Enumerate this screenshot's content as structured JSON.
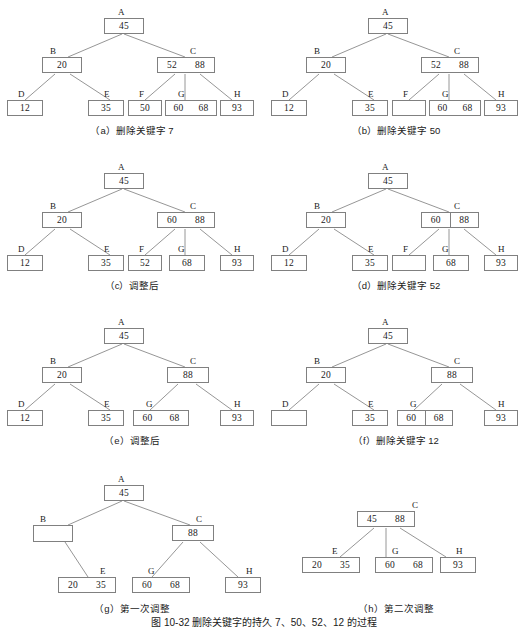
{
  "figure": {
    "caption": "图 10-32  删除关键字的持久 7、50、52、12 的过程",
    "node_label_names": [
      "A",
      "B",
      "C",
      "D",
      "E",
      "F",
      "G",
      "H"
    ]
  },
  "panels": [
    {
      "id": "a",
      "caption": "（a）删除关键字 7",
      "nodes": [
        {
          "name": "A",
          "keys": [
            "45"
          ],
          "divider": false
        },
        {
          "name": "B",
          "keys": [
            "20"
          ],
          "divider": false
        },
        {
          "name": "C",
          "keys": [
            "52",
            "88"
          ],
          "divider": false
        },
        {
          "name": "D",
          "keys": [
            "12"
          ],
          "divider": false
        },
        {
          "name": "E",
          "keys": [
            "35"
          ],
          "divider": false
        },
        {
          "name": "F",
          "keys": [
            "50"
          ],
          "divider": false
        },
        {
          "name": "G",
          "keys": [
            "60",
            "68"
          ],
          "divider": false
        },
        {
          "name": "H",
          "keys": [
            "93"
          ],
          "divider": false
        }
      ]
    },
    {
      "id": "b",
      "caption": "（b）删除关键字 50",
      "nodes": [
        {
          "name": "A",
          "keys": [
            "45"
          ],
          "divider": false
        },
        {
          "name": "B",
          "keys": [
            "20"
          ],
          "divider": false
        },
        {
          "name": "C",
          "keys": [
            "52",
            "88"
          ],
          "divider": false
        },
        {
          "name": "D",
          "keys": [
            "12"
          ],
          "divider": false
        },
        {
          "name": "E",
          "keys": [
            "35"
          ],
          "divider": false
        },
        {
          "name": "F",
          "keys": [
            ""
          ],
          "divider": false
        },
        {
          "name": "G",
          "keys": [
            "60",
            "68"
          ],
          "divider": false
        },
        {
          "name": "H",
          "keys": [
            "93"
          ],
          "divider": false
        }
      ]
    },
    {
      "id": "c",
      "caption": "（c）调整后",
      "nodes": [
        {
          "name": "A",
          "keys": [
            "45"
          ],
          "divider": false
        },
        {
          "name": "B",
          "keys": [
            "20"
          ],
          "divider": false
        },
        {
          "name": "C",
          "keys": [
            "60",
            "88"
          ],
          "divider": false
        },
        {
          "name": "D",
          "keys": [
            "12"
          ],
          "divider": false
        },
        {
          "name": "E",
          "keys": [
            "35"
          ],
          "divider": false
        },
        {
          "name": "F",
          "keys": [
            "52"
          ],
          "divider": false
        },
        {
          "name": "G",
          "keys": [
            "68"
          ],
          "divider": false
        },
        {
          "name": "H",
          "keys": [
            "93"
          ],
          "divider": false
        }
      ]
    },
    {
      "id": "d",
      "caption": "（d）删除关键字 52",
      "nodes": [
        {
          "name": "A",
          "keys": [
            "45"
          ],
          "divider": false
        },
        {
          "name": "B",
          "keys": [
            "20"
          ],
          "divider": false
        },
        {
          "name": "C",
          "keys": [
            "60",
            "88"
          ],
          "divider": true
        },
        {
          "name": "D",
          "keys": [
            "12"
          ],
          "divider": false
        },
        {
          "name": "E",
          "keys": [
            "35"
          ],
          "divider": false
        },
        {
          "name": "F",
          "keys": [
            ""
          ],
          "divider": false
        },
        {
          "name": "G",
          "keys": [
            "68"
          ],
          "divider": false
        },
        {
          "name": "H",
          "keys": [
            "93"
          ],
          "divider": false
        }
      ]
    },
    {
      "id": "e",
      "caption": "（e）调整后",
      "nodes": [
        {
          "name": "A",
          "keys": [
            "45"
          ],
          "divider": false
        },
        {
          "name": "B",
          "keys": [
            "20"
          ],
          "divider": false
        },
        {
          "name": "C",
          "keys": [
            "88"
          ],
          "divider": false
        },
        {
          "name": "D",
          "keys": [
            "12"
          ],
          "divider": false
        },
        {
          "name": "E",
          "keys": [
            "35"
          ],
          "divider": false
        },
        {
          "name": "G",
          "keys": [
            "60",
            "68"
          ],
          "divider": false
        },
        {
          "name": "H",
          "keys": [
            "93"
          ],
          "divider": false
        }
      ]
    },
    {
      "id": "f",
      "caption": "（f）删除关键字 12",
      "nodes": [
        {
          "name": "A",
          "keys": [
            "45"
          ],
          "divider": false
        },
        {
          "name": "B",
          "keys": [
            "20"
          ],
          "divider": false
        },
        {
          "name": "C",
          "keys": [
            "88"
          ],
          "divider": false
        },
        {
          "name": "D",
          "keys": [
            ""
          ],
          "divider": false
        },
        {
          "name": "E",
          "keys": [
            "35"
          ],
          "divider": false
        },
        {
          "name": "G",
          "keys": [
            "60",
            "68"
          ],
          "divider": true
        },
        {
          "name": "H",
          "keys": [
            "93"
          ],
          "divider": false
        }
      ]
    },
    {
      "id": "g",
      "caption": "（g）第一次调整",
      "nodes": [
        {
          "name": "A",
          "keys": [
            "45"
          ],
          "divider": false
        },
        {
          "name": "B",
          "keys": [
            ""
          ],
          "divider": false
        },
        {
          "name": "C",
          "keys": [
            "88"
          ],
          "divider": false
        },
        {
          "name": "E",
          "keys": [
            "20",
            "35"
          ],
          "divider": false
        },
        {
          "name": "G",
          "keys": [
            "60",
            "68"
          ],
          "divider": false
        },
        {
          "name": "H",
          "keys": [
            "93"
          ],
          "divider": false
        }
      ]
    },
    {
      "id": "h",
      "caption": "（h）第二次调整",
      "nodes": [
        {
          "name": "C",
          "keys": [
            "45",
            "88"
          ],
          "divider": false
        },
        {
          "name": "E",
          "keys": [
            "20",
            "35"
          ],
          "divider": false
        },
        {
          "name": "G",
          "keys": [
            "60",
            "68"
          ],
          "divider": false
        },
        {
          "name": "H",
          "keys": [
            "93"
          ],
          "divider": false
        }
      ]
    }
  ]
}
